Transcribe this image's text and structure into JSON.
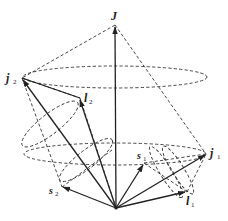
{
  "diagram": {
    "type": "vector-coupling (jj-coupling) diagram",
    "labels": {
      "J": "J",
      "j1_main": "j",
      "j1_sub": "1",
      "j2_main": "j",
      "j2_sub": "2",
      "l1_main": "l",
      "l1_sub": "1",
      "l2_main": "l",
      "l2_sub": "2",
      "s1_main": "s",
      "s1_sub": "1",
      "s2_main": "s",
      "s2_sub": "2"
    },
    "points": {
      "origin": [
        116,
        208
      ],
      "J": [
        115,
        25
      ],
      "j1": [
        206,
        154
      ],
      "j2": [
        22,
        78
      ],
      "l1": [
        187,
        192
      ],
      "l2": [
        80,
        98
      ],
      "s1": [
        144,
        163
      ],
      "s2": [
        62,
        187
      ]
    },
    "colors": {
      "line": "#222222",
      "background": "#ffffff"
    }
  }
}
